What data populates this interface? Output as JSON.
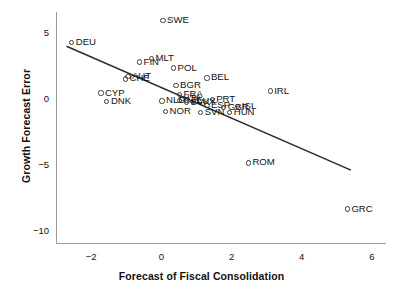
{
  "chart_data": {
    "type": "scatter",
    "title": "",
    "xlabel": "Forecast of Fiscal Consolidation",
    "ylabel": "Growth Forecast Error",
    "xlim": [
      -3.0,
      6.4
    ],
    "ylim": [
      -11.0,
      6.6
    ],
    "xticks": [
      -2,
      0,
      2,
      4,
      6
    ],
    "xticklabels": [
      "−2",
      "0",
      "2",
      "4",
      "6"
    ],
    "yticks": [
      5,
      0,
      -5,
      -10
    ],
    "yticklabels": [
      "5",
      "0",
      "−5",
      "−10"
    ],
    "grid": false,
    "legend": null,
    "marker": "open-circle",
    "points": [
      {
        "label": "DEU",
        "x": -2.55,
        "y": 4.3
      },
      {
        "label": "SWE",
        "x": 0.05,
        "y": 5.95
      },
      {
        "label": "FIN",
        "x": -0.62,
        "y": 2.8
      },
      {
        "label": "MLT",
        "x": -0.28,
        "y": 3.1
      },
      {
        "label": "POL",
        "x": 0.35,
        "y": 2.35
      },
      {
        "label": "AUT",
        "x": -0.95,
        "y": 1.7
      },
      {
        "label": "CHE",
        "x": -1.02,
        "y": 1.52
      },
      {
        "label": "BEL",
        "x": 1.3,
        "y": 1.6
      },
      {
        "label": "IRL",
        "x": 3.1,
        "y": 0.6
      },
      {
        "label": "CYP",
        "x": -1.72,
        "y": 0.45
      },
      {
        "label": "DNK",
        "x": -1.55,
        "y": -0.2
      },
      {
        "label": "BGR",
        "x": 0.42,
        "y": 1.05
      },
      {
        "label": "FRA",
        "x": 0.52,
        "y": 0.32
      },
      {
        "label": "ITA",
        "x": 0.62,
        "y": 0.05
      },
      {
        "label": "CZE",
        "x": 0.52,
        "y": -0.1
      },
      {
        "label": "NLD",
        "x": 0.02,
        "y": -0.15
      },
      {
        "label": "SVK",
        "x": 0.72,
        "y": -0.28
      },
      {
        "label": "LUX",
        "x": 0.9,
        "y": -0.22
      },
      {
        "label": "PRT",
        "x": 1.45,
        "y": -0.05
      },
      {
        "label": "ESP",
        "x": 1.3,
        "y": -0.5
      },
      {
        "label": "GBR",
        "x": 1.78,
        "y": -0.62
      },
      {
        "label": "ISL",
        "x": 2.18,
        "y": -0.55
      },
      {
        "label": "NOR",
        "x": 0.12,
        "y": -0.95
      },
      {
        "label": "SVN",
        "x": 1.12,
        "y": -1.05
      },
      {
        "label": "HUN",
        "x": 1.95,
        "y": -1.05
      },
      {
        "label": "ROM",
        "x": 2.48,
        "y": -4.85
      },
      {
        "label": "GRC",
        "x": 5.3,
        "y": -8.35
      }
    ],
    "fit_line": {
      "name": "regression-line",
      "x0": -2.7,
      "y0": 4.0,
      "x1": 5.4,
      "y1": -5.4
    }
  },
  "axes": {
    "axis_color": "#9a9a9a",
    "tick_color": "#9a9a9a",
    "text_color": "#111111",
    "marker_color": "#3a3a3a",
    "line_color": "#2b2b2b",
    "background": "#ffffff"
  }
}
